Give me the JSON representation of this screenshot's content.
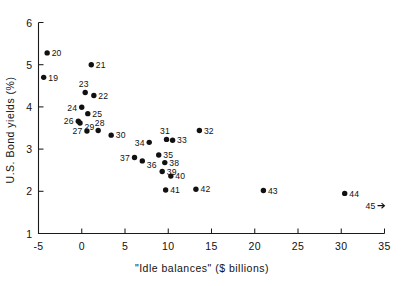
{
  "chart_data": {
    "type": "scatter",
    "title": "",
    "xlabel": "\"Idle balances\" ($ billions)",
    "ylabel": "U.S. Bond yields (%)",
    "xlim": [
      -5,
      35
    ],
    "ylim": [
      1,
      6
    ],
    "xticks": [
      -5,
      0,
      5,
      10,
      15,
      20,
      25,
      30,
      35
    ],
    "xtick_labels": [
      "-5",
      "0",
      "5",
      "10",
      "15",
      "20",
      "25",
      "30",
      "35"
    ],
    "yticks": [
      1,
      2,
      3,
      4,
      5,
      6
    ],
    "ytick_labels": [
      "1",
      "2",
      "3",
      "4",
      "5",
      "6"
    ],
    "grid": false,
    "legend": null,
    "point_labels_shown": true,
    "points": [
      {
        "label": "19",
        "x": -4.4,
        "y": 4.7,
        "label_pos": "right"
      },
      {
        "label": "20",
        "x": -4.0,
        "y": 5.28,
        "label_pos": "right"
      },
      {
        "label": "21",
        "x": 1.1,
        "y": 5.0,
        "label_pos": "right"
      },
      {
        "label": "22",
        "x": 1.4,
        "y": 4.27,
        "label_pos": "right"
      },
      {
        "label": "23",
        "x": 0.4,
        "y": 4.34,
        "label_pos": "above-left"
      },
      {
        "label": "24",
        "x": 0.0,
        "y": 3.99,
        "label_pos": "left"
      },
      {
        "label": "25",
        "x": 0.7,
        "y": 3.84,
        "label_pos": "right"
      },
      {
        "label": "26",
        "x": -0.4,
        "y": 3.66,
        "label_pos": "left"
      },
      {
        "label": "27",
        "x": 0.6,
        "y": 3.43,
        "label_pos": "left"
      },
      {
        "label": "28",
        "x": 1.9,
        "y": 3.44,
        "label_pos": "above-right"
      },
      {
        "label": "29",
        "x": -0.2,
        "y": 3.62,
        "label_pos": "below-right"
      },
      {
        "label": "30",
        "x": 3.4,
        "y": 3.33,
        "label_pos": "right"
      },
      {
        "label": "31",
        "x": 9.8,
        "y": 3.23,
        "label_pos": "above-left"
      },
      {
        "label": "32",
        "x": 13.6,
        "y": 3.44,
        "label_pos": "right"
      },
      {
        "label": "33",
        "x": 10.5,
        "y": 3.21,
        "label_pos": "right"
      },
      {
        "label": "34",
        "x": 7.8,
        "y": 3.16,
        "label_pos": "left"
      },
      {
        "label": "35",
        "x": 8.9,
        "y": 2.86,
        "label_pos": "right"
      },
      {
        "label": "36",
        "x": 7.0,
        "y": 2.72,
        "label_pos": "below-right"
      },
      {
        "label": "37",
        "x": 6.1,
        "y": 2.8,
        "label_pos": "left"
      },
      {
        "label": "38",
        "x": 9.6,
        "y": 2.68,
        "label_pos": "right"
      },
      {
        "label": "39",
        "x": 9.3,
        "y": 2.47,
        "label_pos": "right"
      },
      {
        "label": "40",
        "x": 10.3,
        "y": 2.36,
        "label_pos": "right"
      },
      {
        "label": "41",
        "x": 9.7,
        "y": 2.03,
        "label_pos": "right"
      },
      {
        "label": "42",
        "x": 13.2,
        "y": 2.05,
        "label_pos": "right"
      },
      {
        "label": "43",
        "x": 21.0,
        "y": 2.02,
        "label_pos": "right"
      },
      {
        "label": "44",
        "x": 30.4,
        "y": 1.95,
        "label_pos": "right"
      },
      {
        "label": "45",
        "x": 35.0,
        "y": 1.66,
        "label_pos": "left-arrow",
        "off_scale": true
      }
    ]
  },
  "colors": {
    "marker": "#111111",
    "axis": "#1a1a1a",
    "background": "#ffffff"
  }
}
